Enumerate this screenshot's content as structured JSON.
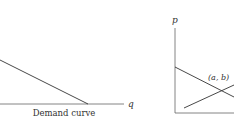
{
  "diagrams": [
    {
      "name": "demand-curve",
      "caption": "Demand curve",
      "x_axis_label": "q"
    },
    {
      "name": "supply-demand",
      "y_axis_label": "p",
      "intersection_label": "(a, b)"
    }
  ],
  "colors": {
    "line": "#333333",
    "axis": "#555555"
  }
}
